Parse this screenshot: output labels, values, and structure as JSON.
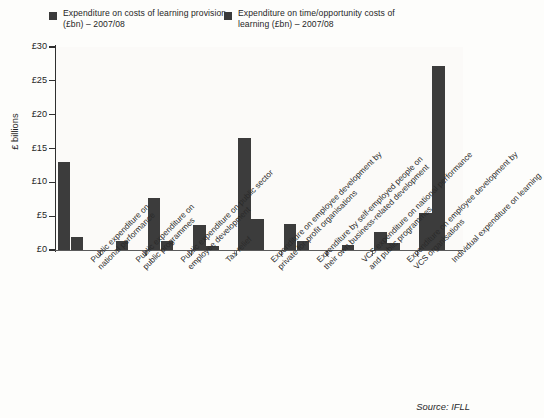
{
  "legend": {
    "entries": [
      {
        "label": "Expenditure on costs of learning\nprovision (£bn) – 2007/08",
        "color": "#3a3a3a",
        "swatch_icon": "legend-square-icon"
      },
      {
        "label": "Expenditure on time/opportunity\ncosts of learning (£bn) – 2007/08",
        "color": "#3a3a3a",
        "swatch_icon": "legend-square-icon"
      }
    ]
  },
  "axis": {
    "y_title": "£ billions",
    "y_ticks": [
      "£0",
      "£5",
      "£10",
      "£15",
      "£20",
      "£25",
      "£30"
    ]
  },
  "source": "Source: IFLL",
  "chart_data": {
    "type": "bar",
    "title": "",
    "xlabel": "",
    "ylabel": "£ billions",
    "ylim": [
      0,
      30
    ],
    "ytick_values": [
      0,
      5,
      10,
      15,
      20,
      25,
      30
    ],
    "grid": false,
    "legend_position": "top",
    "categories": [
      "Public expenditure on\nnational performance",
      "Public expenditure on\npublic programmes",
      "Public expenditure on public sector\nemployee development",
      "Tax relief",
      "Expenditure on employee development by\nprivate for-profit organisations",
      "Expenditure by self-employed people on\ntheir own business-related development",
      "VCS expenditure on national performance\nand public programmes",
      "Expenditure on employee development by\nVCS organisations",
      "Individual expenditure on learning"
    ],
    "series": [
      {
        "name": "Expenditure on costs of learning provision (£bn) – 2007/08",
        "color": "#3c3c3c",
        "values": [
          13.0,
          0.0,
          7.7,
          3.7,
          16.5,
          3.8,
          0.0,
          2.6,
          5.5
        ]
      },
      {
        "name": "Expenditure on time/opportunity costs of learning (£bn) – 2007/08",
        "color": "#3c3c3c",
        "values": [
          1.9,
          1.3,
          1.4,
          0.6,
          4.6,
          1.4,
          0.8,
          1.0,
          27.2
        ]
      }
    ]
  }
}
